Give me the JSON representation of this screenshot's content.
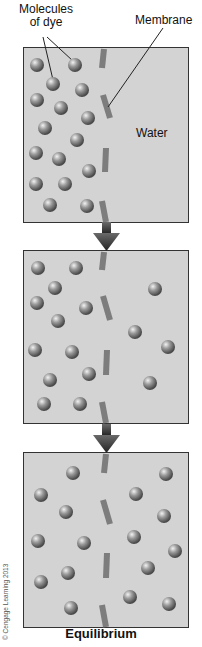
{
  "labels": {
    "dye_line1": "Molecules",
    "dye_line2": "of dye",
    "membrane": "Membrane",
    "water": "Water",
    "caption": "Equilibrium",
    "copyright": "© Cengage Learning 2013"
  },
  "colors": {
    "box_fill": "#d3d3d3",
    "box_border": "#333333",
    "membrane": "#7d7d7d",
    "arrow": "#3a3a3a",
    "molecule": "#8a8a8a"
  },
  "panels": [
    {
      "name": "initial",
      "top": 48,
      "bottom": 222,
      "molecules": [
        [
          37,
          65
        ],
        [
          75,
          65
        ],
        [
          53,
          84
        ],
        [
          82,
          90
        ],
        [
          37,
          100
        ],
        [
          61,
          108
        ],
        [
          88,
          118
        ],
        [
          45,
          128
        ],
        [
          77,
          140
        ],
        [
          36,
          153
        ],
        [
          59,
          159
        ],
        [
          89,
          171
        ],
        [
          36,
          184
        ],
        [
          65,
          184
        ],
        [
          50,
          205
        ],
        [
          87,
          206
        ]
      ]
    },
    {
      "name": "diffusing",
      "top": 251,
      "bottom": 423,
      "molecules": [
        [
          38,
          268
        ],
        [
          76,
          268
        ],
        [
          55,
          288
        ],
        [
          37,
          303
        ],
        [
          86,
          308
        ],
        [
          58,
          321
        ],
        [
          155,
          289
        ],
        [
          35,
          350
        ],
        [
          72,
          352
        ],
        [
          135,
          332
        ],
        [
          168,
          347
        ],
        [
          89,
          374
        ],
        [
          50,
          380
        ],
        [
          150,
          383
        ],
        [
          44,
          404
        ],
        [
          80,
          404
        ]
      ]
    },
    {
      "name": "equilibrium",
      "top": 453,
      "bottom": 627,
      "molecules": [
        [
          73,
          473
        ],
        [
          166,
          474
        ],
        [
          41,
          495
        ],
        [
          136,
          494
        ],
        [
          66,
          512
        ],
        [
          164,
          516
        ],
        [
          134,
          537
        ],
        [
          38,
          541
        ],
        [
          84,
          543
        ],
        [
          175,
          551
        ],
        [
          148,
          568
        ],
        [
          68,
          573
        ],
        [
          41,
          582
        ],
        [
          130,
          597
        ],
        [
          169,
          604
        ],
        [
          71,
          608
        ]
      ]
    }
  ]
}
